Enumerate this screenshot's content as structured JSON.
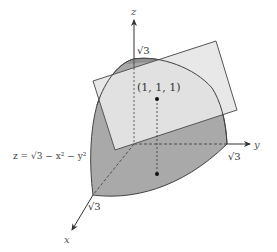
{
  "diagram": {
    "colors": {
      "background": "#ffffff",
      "surface_fill": "#a9a9a9",
      "surface_top_fill": "#9a9a9a",
      "plane_fill": "#e6e6e6",
      "outline": "#444444",
      "axis": "#333333",
      "dashed": "#444444",
      "point": "#111111"
    },
    "axes": {
      "x": {
        "label": "x",
        "tick_label": "√3"
      },
      "y": {
        "label": "y",
        "tick_label": "√3"
      },
      "z": {
        "label": "z",
        "tick_label": "√3"
      }
    },
    "surface": {
      "equation_label": "z = √3 − x² − y²",
      "equation_prefix": "z =",
      "equation_radical": "3 − x² − y²"
    },
    "point": {
      "label": "(1, 1, 1)",
      "coords": [
        1,
        1,
        1
      ]
    },
    "projection_point": {
      "coords": [
        1,
        1,
        0
      ]
    }
  }
}
